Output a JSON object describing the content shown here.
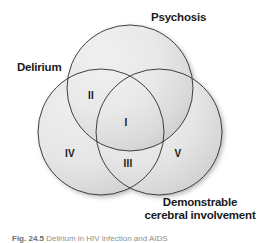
{
  "figure": {
    "type": "venn-diagram",
    "set_count": 3,
    "labels": {
      "top": "Psychosis",
      "left": "Delirium",
      "bottom_right_line1": "Demonstrable",
      "bottom_right_line2": "cerebral involvement"
    },
    "regions": [
      {
        "id": "I",
        "numeral": "I",
        "meaning": "all three sets overlap"
      },
      {
        "id": "II",
        "numeral": "II",
        "meaning": "delirium and psychosis only"
      },
      {
        "id": "III",
        "numeral": "III",
        "meaning": "delirium and demonstrable cerebral involvement only"
      },
      {
        "id": "IV",
        "numeral": "IV",
        "meaning": "delirium only"
      },
      {
        "id": "V",
        "numeral": "V",
        "meaning": "demonstrable cerebral involvement only"
      }
    ],
    "colors": {
      "fill_light": "#ededed",
      "fill_dark": "#c7c7c7",
      "stroke": "#2b2b2b",
      "label_text": "#1a1a1a",
      "caption_text": "#8f8f8f",
      "background": "#ffffff"
    },
    "geometry": {
      "circle_radius": 63,
      "top_center": [
        130,
        88
      ],
      "left_center": [
        101,
        132
      ],
      "right_center": [
        159,
        132
      ]
    }
  },
  "caption": {
    "number": "Fig. 24.5",
    "text": "Delirium in HIV infection and AIDS"
  }
}
